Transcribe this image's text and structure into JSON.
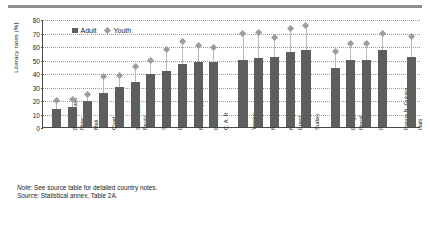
{
  "chart_data": {
    "type": "bar",
    "title": "",
    "xlabel": "",
    "ylabel": "Literacy rates (%)",
    "ylim": [
      0,
      80
    ],
    "yticks": [
      "0",
      "10",
      "20",
      "30",
      "40",
      "50",
      "60",
      "70",
      "80"
    ],
    "grid": true,
    "legend_position": "top-left",
    "categories": [
      "Burkina Faso",
      "Niger",
      "Mali",
      "Chad",
      "Sierra Leone",
      "Benin",
      "Senegal",
      "Ethiopia",
      "Mozambique",
      "Côte d'Ivoire",
      "C. A. R.",
      "Yemen",
      "Morocco",
      "Mauritania",
      "Egypt",
      "Sudan",
      "Bangladesh",
      "Nepal",
      "Pakistan",
      "Papua N. Guinea",
      "Haiti"
    ],
    "group_breaks_after": [
      "C. A. R.",
      "Sudan",
      "Papua N. Guinea"
    ],
    "series": [
      {
        "name": "Adult",
        "marker": "square",
        "color": "#5e5e5e",
        "values": [
          13,
          14.5,
          19,
          25.5,
          29.5,
          33.5,
          39,
          41.5,
          46.5,
          48,
          48.5,
          50,
          51,
          51.5,
          55.5,
          57,
          44,
          50,
          50,
          57,
          52
        ]
      },
      {
        "name": "Youth",
        "marker": "diamond",
        "color": "#9d9d9d",
        "values": [
          19.5,
          20,
          24,
          37,
          38,
          44.5,
          49,
          57.5,
          63,
          60,
          59,
          69,
          70,
          66,
          73,
          75,
          56,
          62,
          62,
          69,
          67
        ]
      }
    ]
  },
  "legend": {
    "items": [
      {
        "label": "Adult",
        "marker": "square"
      },
      {
        "label": "Youth",
        "marker": "diamond"
      }
    ]
  },
  "notes": {
    "note_lead": "Note:",
    "note_text": " See source table for detailed country notes.",
    "source_lead": "Source:",
    "source_text": " Statistical annex, Table 2A."
  }
}
